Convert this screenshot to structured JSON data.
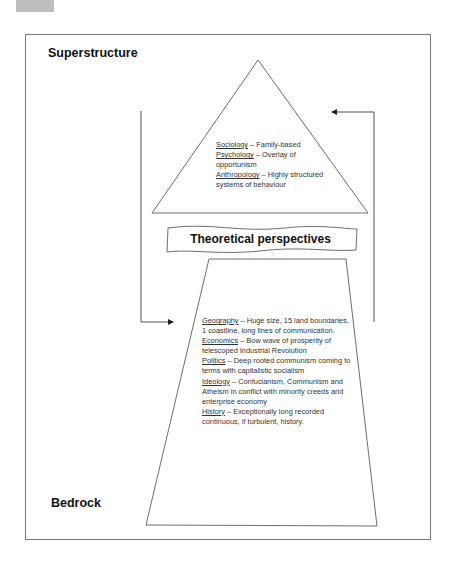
{
  "diagram": {
    "labels": {
      "top": "Superstructure",
      "bottom": "Bedrock",
      "banner": "Theoretical perspectives"
    },
    "superstructure_items": [
      {
        "term": "Sociology",
        "desc": " – Family-based"
      },
      {
        "term": "Psychology",
        "desc": " – Overlay of opportunism"
      },
      {
        "term": "Anthropology",
        "desc": " – Highly structured systems of behaviour"
      }
    ],
    "bedrock_items": [
      {
        "term": "Geography",
        "desc": " – Huge size, 15 land boundaries, 1 coastline, long lines of communication."
      },
      {
        "term": "Economics",
        "desc": " – Bow wave of prosperity of telescoped Industrial Revolution"
      },
      {
        "term": "Politics",
        "desc": " – Deep rooted communism coming to terms with capitalistic socialism"
      },
      {
        "term": "Ideology",
        "desc": " – Confucianism, Communism and Atheism in conflict with minority creeds and enterprise economy"
      },
      {
        "term": "History",
        "desc": " – Exceptionally long recorded continuous, if turbulent, history."
      }
    ],
    "colors": {
      "stroke": "#6e6e6e",
      "text": "#333333"
    }
  }
}
